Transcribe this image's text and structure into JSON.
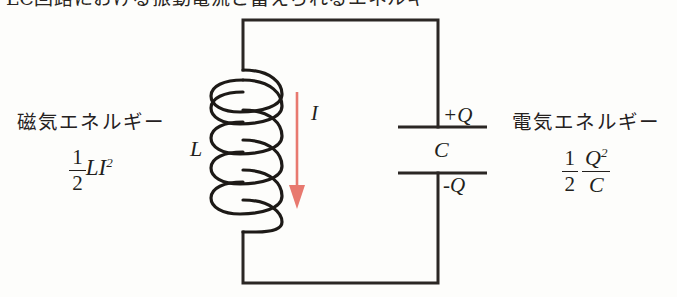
{
  "figure": {
    "type": "lc-oscillation-circuit-diagram",
    "background_color": "#fdfdfb",
    "ink_color": "#231f1c",
    "accent_color": "#e8796f",
    "cropped_top_text": "LC回路における振動電流と蓄えられるエネルギー"
  },
  "left_energy": {
    "caption": "磁気エネルギー",
    "coefficient_numerator": "1",
    "coefficient_denominator": "2",
    "expression_body": "LI",
    "expression_exponent": "2"
  },
  "right_energy": {
    "caption": "電気エネルギー",
    "coefficient_numerator": "1",
    "coefficient_denominator": "2",
    "fraction_numerator": "Q",
    "fraction_numerator_exponent": "2",
    "fraction_denominator": "C"
  },
  "components": {
    "inductor_label": "L",
    "capacitor_label": "C",
    "current_label": "I",
    "charge_positive": "+Q",
    "charge_negative": "-Q"
  }
}
